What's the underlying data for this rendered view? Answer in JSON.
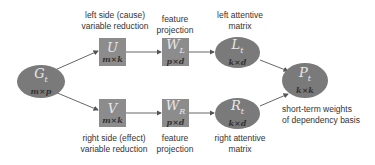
{
  "nodes": {
    "G": {
      "symbol": "G",
      "sub": "t",
      "dim": "m×p"
    },
    "U": {
      "symbol": "U",
      "sub": "",
      "dim": "m×k"
    },
    "V": {
      "symbol": "V",
      "sub": "",
      "dim": "m×k"
    },
    "WL": {
      "symbol": "W",
      "sub": "L",
      "dim": "p×d"
    },
    "WR": {
      "symbol": "W",
      "sub": "R",
      "dim": "p×d"
    },
    "L": {
      "symbol": "L",
      "sub": "t",
      "dim": "k×d"
    },
    "R": {
      "symbol": "R",
      "sub": "t",
      "dim": "k×d"
    },
    "P": {
      "symbol": "P",
      "sub": "t",
      "dim": "k×k"
    }
  },
  "labels": {
    "left_reduction": [
      "left side (cause)",
      "variable reduction"
    ],
    "right_reduction": [
      "right side (effect)",
      "variable reduction"
    ],
    "feature_top": [
      "feature",
      "projection"
    ],
    "feature_bottom": [
      "feature",
      "projection"
    ],
    "left_matrix": [
      "left attentive",
      "matrix"
    ],
    "right_matrix": [
      "right attentive",
      "matrix"
    ],
    "weights": [
      "short-term weights",
      "of dependency basis"
    ]
  },
  "colors": {
    "node_box": "#8c8c8c",
    "node_ellipse": "#7a7a7a",
    "edge": "#555555"
  }
}
